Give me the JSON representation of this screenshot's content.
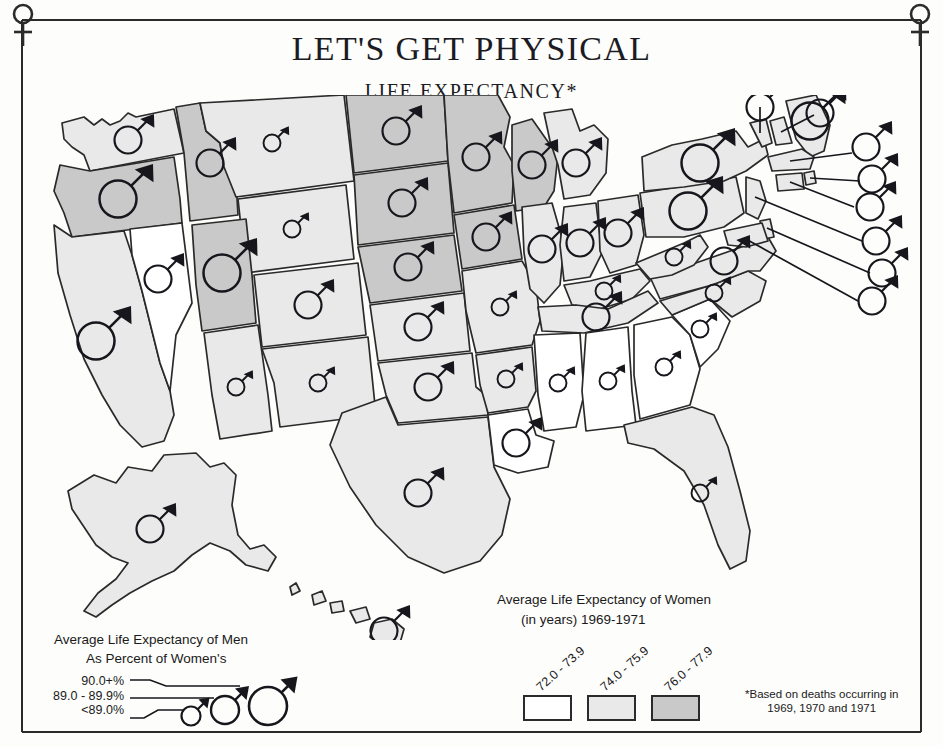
{
  "title": "LET'S GET PHYSICAL",
  "subtitle": "LIFE EXPECTANCY*",
  "corner_icon": "venus-symbol",
  "legend_men": {
    "caption_line1": "Average Life Expectancy of Men",
    "caption_line2": "As Percent of Women's",
    "keys": [
      {
        "label": "90.0+%",
        "symbol_size": "small"
      },
      {
        "label": "89.0 - 89.9%",
        "symbol_size": "medium"
      },
      {
        "label": "<89.0%",
        "symbol_size": "large"
      }
    ]
  },
  "legend_women": {
    "caption_line1": "Average Life Expectancy of Women",
    "caption_line2": "(in years) 1969-1971",
    "swatches": [
      {
        "label": "72.0 - 73.9",
        "color": "#ffffff"
      },
      {
        "label": "74.0 - 75.9",
        "color": "#e9e9e9"
      },
      {
        "label": "76.0 - 77.9",
        "color": "#c9c9c9"
      }
    ]
  },
  "footnote": "*Based on deaths occurring in\n1969, 1970 and 1971",
  "chart_data": {
    "type": "map",
    "title": "LET'S GET PHYSICAL",
    "subtitle": "LIFE EXPECTANCY*",
    "region": "United States",
    "fill_variable": "Average Life Expectancy of Women (in years) 1969-1971",
    "fill_classes": [
      {
        "label": "72.0 - 73.9",
        "color": "#ffffff",
        "class": 0
      },
      {
        "label": "74.0 - 75.9",
        "color": "#e9e9e9",
        "class": 1
      },
      {
        "label": "76.0 - 77.9",
        "color": "#c9c9c9",
        "class": 2
      }
    ],
    "symbol_variable": "Average Life Expectancy of Men As Percent of Women's",
    "symbol_classes": [
      {
        "label": "90.0+%",
        "size": "small",
        "class": 0
      },
      {
        "label": "89.0 - 89.9%",
        "size": "medium",
        "class": 1
      },
      {
        "label": "<89.0%",
        "size": "large",
        "class": 2
      }
    ],
    "states": [
      {
        "code": "WA",
        "fill": 1,
        "symbol": 1
      },
      {
        "code": "OR",
        "fill": 2,
        "symbol": 2
      },
      {
        "code": "CA",
        "fill": 1,
        "symbol": 2
      },
      {
        "code": "NV",
        "fill": 0,
        "symbol": 1
      },
      {
        "code": "ID",
        "fill": 2,
        "symbol": 1
      },
      {
        "code": "MT",
        "fill": 1,
        "symbol": 0
      },
      {
        "code": "WY",
        "fill": 1,
        "symbol": 0
      },
      {
        "code": "UT",
        "fill": 2,
        "symbol": 2
      },
      {
        "code": "AZ",
        "fill": 1,
        "symbol": 0
      },
      {
        "code": "NM",
        "fill": 1,
        "symbol": 0
      },
      {
        "code": "CO",
        "fill": 1,
        "symbol": 1
      },
      {
        "code": "ND",
        "fill": 2,
        "symbol": 1
      },
      {
        "code": "SD",
        "fill": 2,
        "symbol": 1
      },
      {
        "code": "NE",
        "fill": 2,
        "symbol": 1
      },
      {
        "code": "KS",
        "fill": 1,
        "symbol": 1
      },
      {
        "code": "OK",
        "fill": 1,
        "symbol": 1
      },
      {
        "code": "TX",
        "fill": 1,
        "symbol": 1
      },
      {
        "code": "MN",
        "fill": 2,
        "symbol": 1
      },
      {
        "code": "IA",
        "fill": 2,
        "symbol": 1
      },
      {
        "code": "MO",
        "fill": 1,
        "symbol": 0
      },
      {
        "code": "AR",
        "fill": 1,
        "symbol": 0
      },
      {
        "code": "LA",
        "fill": 0,
        "symbol": 1
      },
      {
        "code": "WI",
        "fill": 2,
        "symbol": 1
      },
      {
        "code": "IL",
        "fill": 1,
        "symbol": 1
      },
      {
        "code": "MI",
        "fill": 1,
        "symbol": 1
      },
      {
        "code": "IN",
        "fill": 1,
        "symbol": 1
      },
      {
        "code": "OH",
        "fill": 1,
        "symbol": 1
      },
      {
        "code": "KY",
        "fill": 1,
        "symbol": 0
      },
      {
        "code": "TN",
        "fill": 1,
        "symbol": 1
      },
      {
        "code": "MS",
        "fill": 0,
        "symbol": 0
      },
      {
        "code": "AL",
        "fill": 0,
        "symbol": 0
      },
      {
        "code": "GA",
        "fill": 0,
        "symbol": 0
      },
      {
        "code": "FL",
        "fill": 1,
        "symbol": 0
      },
      {
        "code": "SC",
        "fill": 0,
        "symbol": 0
      },
      {
        "code": "NC",
        "fill": 1,
        "symbol": 0
      },
      {
        "code": "VA",
        "fill": 1,
        "symbol": 1
      },
      {
        "code": "WV",
        "fill": 1,
        "symbol": 0
      },
      {
        "code": "PA",
        "fill": 1,
        "symbol": 2
      },
      {
        "code": "NY",
        "fill": 1,
        "symbol": 2
      },
      {
        "code": "VT",
        "fill": 1,
        "symbol": 1
      },
      {
        "code": "NH",
        "fill": 1,
        "symbol": 1
      },
      {
        "code": "ME",
        "fill": 1,
        "symbol": 2
      },
      {
        "code": "MA",
        "fill": 1,
        "symbol": 1
      },
      {
        "code": "RI",
        "fill": 1,
        "symbol": 1
      },
      {
        "code": "CT",
        "fill": 1,
        "symbol": 1
      },
      {
        "code": "NJ",
        "fill": 1,
        "symbol": 1
      },
      {
        "code": "DE",
        "fill": 1,
        "symbol": 1
      },
      {
        "code": "MD",
        "fill": 1,
        "symbol": 1
      },
      {
        "code": "AK",
        "fill": 1,
        "symbol": 1
      },
      {
        "code": "HI",
        "fill": 1,
        "symbol": 1
      }
    ]
  }
}
